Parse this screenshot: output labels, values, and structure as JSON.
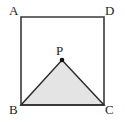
{
  "figure": {
    "background_color": "#ffffff",
    "canvas": {
      "width": 125,
      "height": 122
    }
  },
  "labels": {
    "a": "A",
    "b": "B",
    "c": "C",
    "d": "D",
    "p": "P"
  },
  "style": {
    "stroke_color": "#3a3a3a",
    "stroke_width": 1.6,
    "triangle_fill": "#e4e4e4",
    "triangle_stroke": "#2b2b2b",
    "point_color": "#111111",
    "label_color": "#1d1d1d"
  },
  "geometry": {
    "square": {
      "name": "ABCD",
      "points": [
        {
          "name": "A",
          "x": 21,
          "y": 17
        },
        {
          "name": "D",
          "x": 104,
          "y": 17
        },
        {
          "name": "C",
          "x": 104,
          "y": 105
        },
        {
          "name": "B",
          "x": 21,
          "y": 105
        }
      ],
      "path": "21,17 104,17 104,105 21,105"
    },
    "triangle": {
      "name": "BPC",
      "points": [
        {
          "name": "B",
          "x": 21,
          "y": 105
        },
        {
          "name": "P",
          "x": 62,
          "y": 60
        },
        {
          "name": "C",
          "x": 104,
          "y": 105
        }
      ],
      "path": "21,105 62,60 104,105"
    },
    "marked_point": {
      "name": "P",
      "x": 62,
      "y": 60,
      "radius": 2.3
    }
  }
}
